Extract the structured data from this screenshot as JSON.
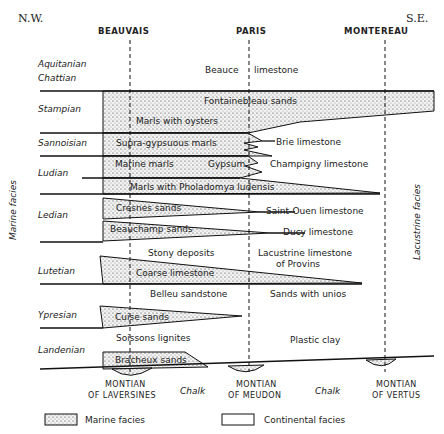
{
  "directions": {
    "left": "N.W.",
    "right": "S.E."
  },
  "localities": [
    "BEAUVAIS",
    "PARIS",
    "MONTEREAU"
  ],
  "side_labels": {
    "left": "Marine facies",
    "right": "Lacustrine facies"
  },
  "stages": {
    "aquitanian": "Aquitanian",
    "chattian": "Chattian",
    "stampian": "Stampian",
    "sannoisian": "Sannoisian",
    "ludian": "Ludian",
    "ledian": "Ledian",
    "lutetian": "Lutetian",
    "ypresian": "Ypresian",
    "landenian": "Landenian"
  },
  "formations": {
    "beauce": "Beauce",
    "beauce2": "limestone",
    "fontainebleau": "Fontainebleau sands",
    "oysters": "Marls with oysters",
    "supra": "Supra-gypsuous marls",
    "brie": "Brie limestone",
    "marine_marls": "Marine marls",
    "gypsum": "Gypsum",
    "champigny": "Champigny limestone",
    "pholadomya": "Marls with Pholadomya ludensis",
    "cresnes": "Cresnes sands",
    "saint_ouen": "Saint-Ouen limestone",
    "beauchamp": "Beauchamp sands",
    "ducy": "Ducy limestone",
    "stony": "Stony deposits",
    "provins1": "Lacustrine limestone",
    "provins2": "of Provins",
    "coarse": "Coarse limestone",
    "belleu": "Belleu sandstone",
    "unios": "Sands with unios",
    "cuise": "Cuise sands",
    "soissons": "Soissons lignites",
    "plastic": "Plastic clay",
    "bracheux": "Bracheux sands"
  },
  "bottom": {
    "montian1a": "MONTIAN",
    "montian1b": "OF LAVERSINES",
    "chalk1": "Chalk",
    "montian2a": "MONTIAN",
    "montian2b": "OF MEUDON",
    "chalk2": "Chalk",
    "montian3a": "MONTIAN",
    "montian3b": "OF VERTUS"
  },
  "legend": {
    "marine": "Marine facies",
    "continental": "Continental facies"
  }
}
